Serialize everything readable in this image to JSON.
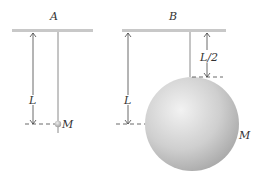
{
  "diagram": {
    "panels": [
      {
        "id": "A",
        "label": "A",
        "length_label": "L",
        "mass_label": "M",
        "description": "Point mass M on a string of length L"
      },
      {
        "id": "B",
        "label": "B",
        "length_label": "L",
        "half_length_label": "L/2",
        "mass_label": "M",
        "description": "Sphere of mass M hung from string of length L/2, center at distance L"
      }
    ],
    "colors": {
      "ceiling": "#c8c8c8",
      "string": "#8a8a8a",
      "sphere_light": "#f0f0f0",
      "sphere_dark": "#a8a8a8",
      "dim_line": "#444444"
    }
  }
}
